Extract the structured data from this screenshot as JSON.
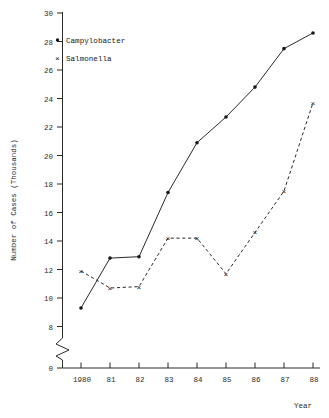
{
  "chart_data": {
    "type": "line",
    "title": "",
    "xlabel": "Year",
    "ylabel": "Number of Cases (Thousands)",
    "x": [
      1980,
      1981,
      1982,
      1983,
      1984,
      1985,
      1986,
      1987,
      1988
    ],
    "xtick_labels": [
      "1980",
      "81",
      "82",
      "83",
      "84",
      "85",
      "86",
      "87",
      "88"
    ],
    "ytick_labels": [
      "0",
      "8",
      "10",
      "12",
      "14",
      "16",
      "18",
      "20",
      "22",
      "24",
      "26",
      "28",
      "30"
    ],
    "ytick_values": [
      0,
      8,
      10,
      12,
      14,
      16,
      18,
      20,
      22,
      24,
      26,
      28,
      30
    ],
    "ylim": [
      8,
      30
    ],
    "axis_break": true,
    "grid": false,
    "legend_position": "top-left-inside",
    "series": [
      {
        "name": "Campylobacter",
        "marker": "dot",
        "line_style": "solid",
        "values": [
          9.3,
          12.8,
          12.9,
          17.4,
          20.9,
          22.7,
          24.8,
          27.5,
          28.6
        ]
      },
      {
        "name": "Salmonella",
        "marker": "x",
        "line_style": "dashed",
        "values": [
          11.9,
          10.7,
          10.8,
          14.2,
          14.2,
          11.7,
          14.6,
          17.5,
          23.7
        ]
      }
    ]
  },
  "legend": {
    "entries": [
      {
        "label": "Campylobacter",
        "symbol": "•"
      },
      {
        "label": "Salmonella",
        "symbol": "×"
      }
    ]
  },
  "axes": {
    "y_title": "Number of Cases (Thousands)",
    "x_title": "Year"
  }
}
